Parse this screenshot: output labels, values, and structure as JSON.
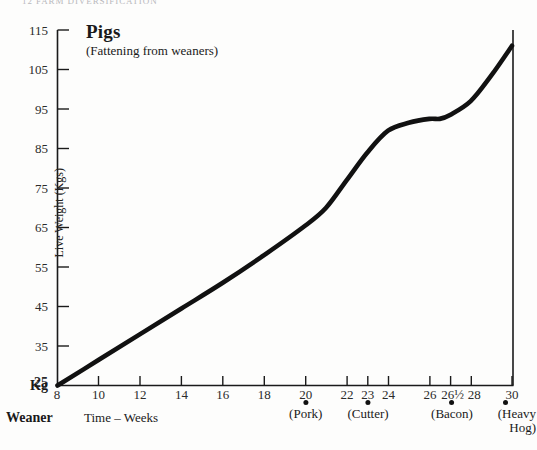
{
  "page_header": "12   FARM DIVERSIFICATION",
  "chart_data": {
    "type": "line",
    "title": "Pigs",
    "subtitle": "(Fattening from weaners)",
    "xlabel": "Time – Weeks",
    "ylabel": "Live Weight (Kgs)",
    "y_unit_label": "Kg",
    "origin_label": "Weaner",
    "xlim": [
      8,
      30
    ],
    "ylim": [
      25,
      115
    ],
    "grid": false,
    "legend": false,
    "y_ticks": [
      115,
      105,
      95,
      85,
      75,
      65,
      55,
      45,
      35,
      25
    ],
    "x_ticks": [
      {
        "value": 8,
        "label": "8"
      },
      {
        "value": 10,
        "label": "10"
      },
      {
        "value": 12,
        "label": "12"
      },
      {
        "value": 14,
        "label": "14"
      },
      {
        "value": 16,
        "label": "16"
      },
      {
        "value": 18,
        "label": "18"
      },
      {
        "value": 20,
        "label": "20"
      },
      {
        "value": 22,
        "label": "22"
      },
      {
        "value": 23,
        "label": "23"
      },
      {
        "value": 24,
        "label": "24"
      },
      {
        "value": 26,
        "label": "26"
      },
      {
        "value": 26.5,
        "label": "26½"
      },
      {
        "value": 28,
        "label": "28"
      },
      {
        "value": 30,
        "label": "30"
      }
    ],
    "series": [
      {
        "name": "Live weight",
        "x": [
          8,
          10,
          12,
          14,
          16,
          18,
          20,
          21,
          22,
          23,
          24,
          25,
          26,
          26.5,
          27,
          28,
          29,
          30
        ],
        "values": [
          25,
          31.5,
          38,
          44.5,
          51,
          58,
          65.5,
          70,
          77,
          84,
          89.5,
          91.5,
          92.5,
          92.5,
          93.5,
          97,
          103.5,
          111
        ]
      }
    ],
    "annotations": [
      {
        "label": "(Pork)",
        "x": 20,
        "marker": "dot"
      },
      {
        "label": "(Cutter)",
        "x": 23,
        "marker": "dot"
      },
      {
        "label": "(Bacon)",
        "x": 26.5,
        "marker": "dot"
      },
      {
        "label": "(Heavy",
        "label2": "Hog)",
        "x": 30,
        "marker": "dot"
      }
    ]
  }
}
